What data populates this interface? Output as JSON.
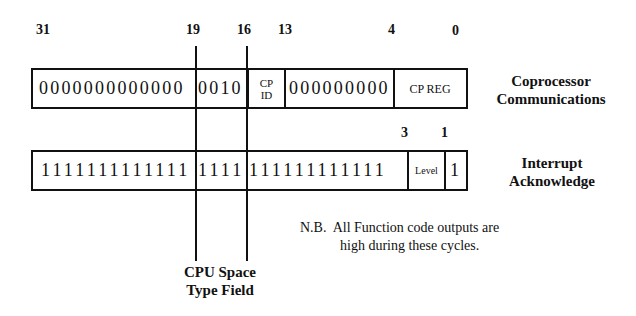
{
  "diagram": {
    "bit_numbers_top": [
      {
        "label": "31",
        "x": 36
      },
      {
        "label": "19",
        "x": 188
      },
      {
        "label": "16",
        "x": 239
      },
      {
        "label": "13",
        "x": 279
      },
      {
        "label": "4",
        "x": 388
      },
      {
        "label": "0",
        "x": 452
      }
    ],
    "bit_numbers_middle": [
      {
        "label": "3",
        "x": 401
      },
      {
        "label": "1",
        "x": 441
      }
    ],
    "coprocessor": {
      "high_bits": "0000000000000",
      "type_bits": "0010",
      "cp_id_line1": "CP",
      "cp_id_line2": "ID",
      "zero_bits": "000000000",
      "cp_reg": "CP REG",
      "label_line1": "Coprocessor",
      "label_line2": "Communications"
    },
    "interrupt": {
      "high_bits": "1111111111111",
      "type_bits": "1111",
      "low_bits": "111111111111",
      "level": "Level",
      "last_bit": "1",
      "label_line1": "Interrupt",
      "label_line2": "Acknowledge"
    },
    "note": {
      "line1": "N.B.  All Function code outputs are",
      "line2": "high during these cycles."
    },
    "type_field_label": {
      "line1": "CPU Space",
      "line2": "Type Field"
    }
  }
}
